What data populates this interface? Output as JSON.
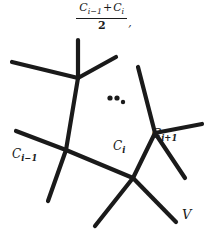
{
  "figure": {
    "type": "mathematical-diagram",
    "ink_color": "#1a1a1a",
    "background_color": "#ffffff"
  },
  "formula": {
    "numerator_left": "C",
    "numerator_left_sub": "i−1",
    "operator": "+",
    "numerator_right": "C",
    "numerator_right_sub": "i",
    "denominator": "2",
    "trailing_punctuation": ","
  },
  "labels": {
    "c_prev": {
      "base": "C",
      "sub": "i−1"
    },
    "c_curr": {
      "base": "C",
      "sub": "i"
    },
    "c_next": {
      "base": "C",
      "sub": "i+1"
    },
    "vertex": "V"
  },
  "ellipsis": {
    "name": "ellipsis-dots",
    "count": 3
  },
  "graph": {
    "vertices": [
      {
        "id": "top",
        "x": 78,
        "y": 78
      },
      {
        "id": "left",
        "x": 66,
        "y": 150
      },
      {
        "id": "mid",
        "x": 133,
        "y": 178
      },
      {
        "id": "right",
        "x": 155,
        "y": 133
      }
    ],
    "edges": [
      {
        "from": "top",
        "to_x": 12,
        "to_y": 62,
        "name": "edge-top-upper-left"
      },
      {
        "from": "top",
        "to_x": 78,
        "to_y": 40,
        "name": "edge-top-up"
      },
      {
        "from": "top",
        "to_x": 116,
        "to_y": 57,
        "name": "edge-top-upper-right"
      },
      {
        "from": "top",
        "to_x": 66,
        "to_y": 150,
        "name": "edge-top-left"
      },
      {
        "from": "left",
        "to_x": 16,
        "to_y": 131,
        "name": "edge-left-west"
      },
      {
        "from": "left",
        "to_x": 48,
        "to_y": 201,
        "name": "edge-left-southwest"
      },
      {
        "from": "left",
        "to_x": 133,
        "to_y": 178,
        "name": "edge-left-mid"
      },
      {
        "from": "mid",
        "to_x": 95,
        "to_y": 226,
        "name": "edge-mid-southwest"
      },
      {
        "from": "mid",
        "to_x": 176,
        "to_y": 222,
        "name": "edge-mid-southeast"
      },
      {
        "from": "mid",
        "to_x": 155,
        "to_y": 133,
        "name": "edge-mid-right"
      },
      {
        "from": "right",
        "to_x": 138,
        "to_y": 67,
        "name": "edge-right-north"
      },
      {
        "from": "right",
        "to_x": 202,
        "to_y": 124,
        "name": "edge-right-east"
      },
      {
        "from": "right",
        "to_x": 185,
        "to_y": 178,
        "name": "edge-right-southeast"
      }
    ],
    "dots": [
      {
        "x": 110,
        "y": 98,
        "r": 2.6
      },
      {
        "x": 117,
        "y": 98,
        "r": 2.6
      },
      {
        "x": 123,
        "y": 102,
        "r": 2.2
      }
    ]
  }
}
